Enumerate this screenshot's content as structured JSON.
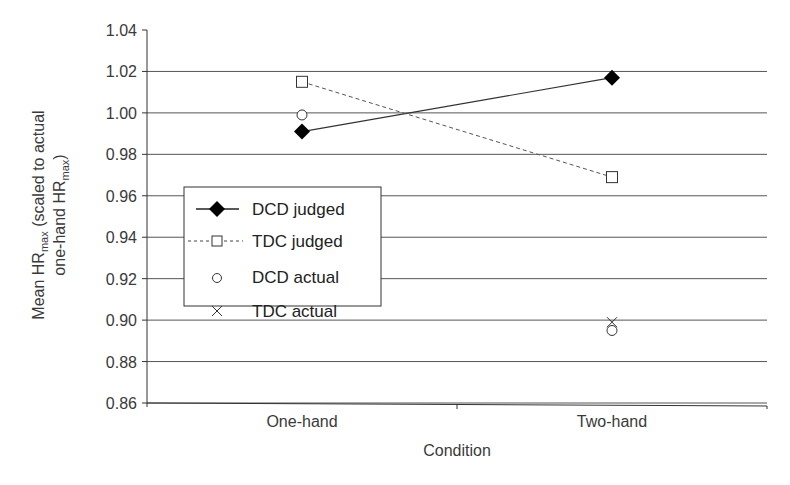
{
  "chart_data": {
    "type": "line",
    "title": "",
    "xlabel": "Condition",
    "ylabel_line1": "Mean HR",
    "ylabel_sub1": "max",
    "ylabel_line1_rest": " (scaled to actual",
    "ylabel_line2": "one-hand HR",
    "ylabel_sub2": "max",
    "ylabel_line2_rest": ")",
    "ylabel": "Mean HRmax (scaled to actual one-hand HRmax)",
    "categories": [
      "One-hand",
      "Two-hand"
    ],
    "ylim": [
      0.86,
      1.04
    ],
    "yticks": [
      "1.04",
      "1.02",
      "1.00",
      "0.98",
      "0.96",
      "0.94",
      "0.92",
      "0.90",
      "0.88",
      "0.86"
    ],
    "grid": true,
    "legend_position": "inside-left",
    "series": [
      {
        "name": "DCD judged",
        "values": [
          0.991,
          1.017
        ],
        "line": "solid",
        "marker": "filled-diamond"
      },
      {
        "name": "TDC judged",
        "values": [
          1.015,
          0.969
        ],
        "line": "dashed",
        "marker": "open-square"
      },
      {
        "name": "DCD actual",
        "values": [
          0.999,
          0.895
        ],
        "line": "none",
        "marker": "open-circle"
      },
      {
        "name": "TDC actual",
        "values": [
          null,
          0.899
        ],
        "line": "none",
        "marker": "x"
      }
    ]
  },
  "legend": {
    "items": [
      {
        "label": "DCD judged"
      },
      {
        "label": "TDC judged"
      },
      {
        "label": "DCD actual"
      },
      {
        "label": "TDC actual"
      }
    ]
  }
}
